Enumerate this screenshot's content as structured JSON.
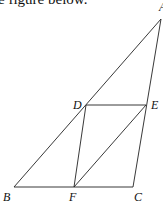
{
  "caption": "e figure below.",
  "figure": {
    "points": {
      "A": {
        "label": "A",
        "x": 161,
        "y": 19,
        "lx": 159,
        "ly": 11
      },
      "B": {
        "label": "B",
        "x": 14,
        "y": 187,
        "lx": 3,
        "ly": 201
      },
      "C": {
        "label": "C",
        "x": 133,
        "y": 187,
        "lx": 134,
        "ly": 201
      },
      "D": {
        "label": "D",
        "x": 86,
        "y": 105,
        "lx": 73,
        "ly": 109
      },
      "E": {
        "label": "E",
        "x": 146,
        "y": 105,
        "lx": 151,
        "ly": 109
      },
      "F": {
        "label": "F",
        "x": 74,
        "y": 187,
        "lx": 69,
        "ly": 201
      }
    },
    "segments": [
      [
        "A",
        "B"
      ],
      [
        "A",
        "C"
      ],
      [
        "B",
        "C"
      ],
      [
        "D",
        "E"
      ],
      [
        "D",
        "F"
      ],
      [
        "E",
        "F"
      ]
    ],
    "stroke_color": "#222222"
  }
}
